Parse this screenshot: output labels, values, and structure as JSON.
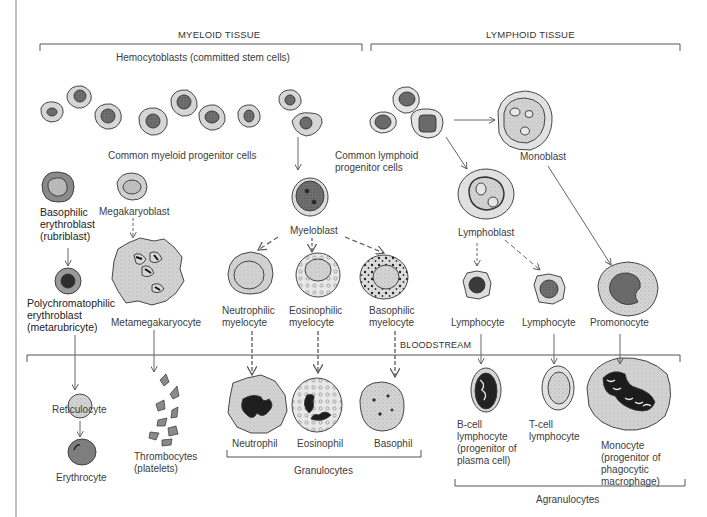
{
  "sections": {
    "myeloid": "MYELOID TISSUE",
    "lymphoid": "LYMPHOID TISSUE",
    "bloodstream": "BLOODSTREAM"
  },
  "labels": {
    "hemocytoblasts": "Hemocytoblasts (committed stem cells)",
    "common_myeloid": "Common myeloid progenitor cells",
    "common_lymphoid_1": "Common lymphoid",
    "common_lymphoid_2": "progenitor cells",
    "monoblast": "Monoblast",
    "basophilic_erythroblast_1": "Basophilic",
    "basophilic_erythroblast_2": "erythroblast",
    "basophilic_erythroblast_3": "(rubriblast)",
    "megakaryoblast": "Megakaryoblast",
    "myeloblast": "Myeloblast",
    "lymphoblast": "Lymphoblast",
    "polychromatophilic_1": "Polychromatophilic",
    "polychromatophilic_2": "erythroblast",
    "polychromatophilic_3": "(metarubricyte)",
    "metamegakaryocyte": "Metamegakaryocyte",
    "neutrophilic_myelocyte_1": "Neutrophilic",
    "neutrophilic_myelocyte_2": "myelocyte",
    "eosinophilic_myelocyte_1": "Eosinophilic",
    "eosinophilic_myelocyte_2": "myelocyte",
    "basophilic_myelocyte_1": "Basophilic",
    "basophilic_myelocyte_2": "myelocyte",
    "lymphocyte_1": "Lymphocyte",
    "lymphocyte_2": "Lymphocyte",
    "promonocyte": "Promonocyte",
    "reticulocyte": "Reticulocyte",
    "erythrocyte": "Erythrocyte",
    "thrombocytes_1": "Thrombocytes",
    "thrombocytes_2": "(platelets)",
    "neutrophil": "Neutrophil",
    "eosinophil": "Eosinophil",
    "basophil": "Basophil",
    "granulocytes": "Granulocytes",
    "bcell_1": "B-cell",
    "bcell_2": "lymphocyte",
    "bcell_3": "(progenitor of",
    "bcell_4": "plasma cell)",
    "tcell_1": "T-cell",
    "tcell_2": "lymphocyte",
    "monocyte_1": "Monocyte",
    "monocyte_2": "(progenitor of",
    "monocyte_3": "phagocytic",
    "monocyte_4": "macrophage)",
    "agranulocytes": "Agranulocytes"
  },
  "colors": {
    "cytoplasm": "#d6d6d6",
    "cytoplasm_light": "#e6e6e6",
    "nucleus": "#6e6e6e",
    "nucleus_dark": "#2a2a2a",
    "erythrocyte": "#7a7a7a",
    "line": "#555555"
  }
}
